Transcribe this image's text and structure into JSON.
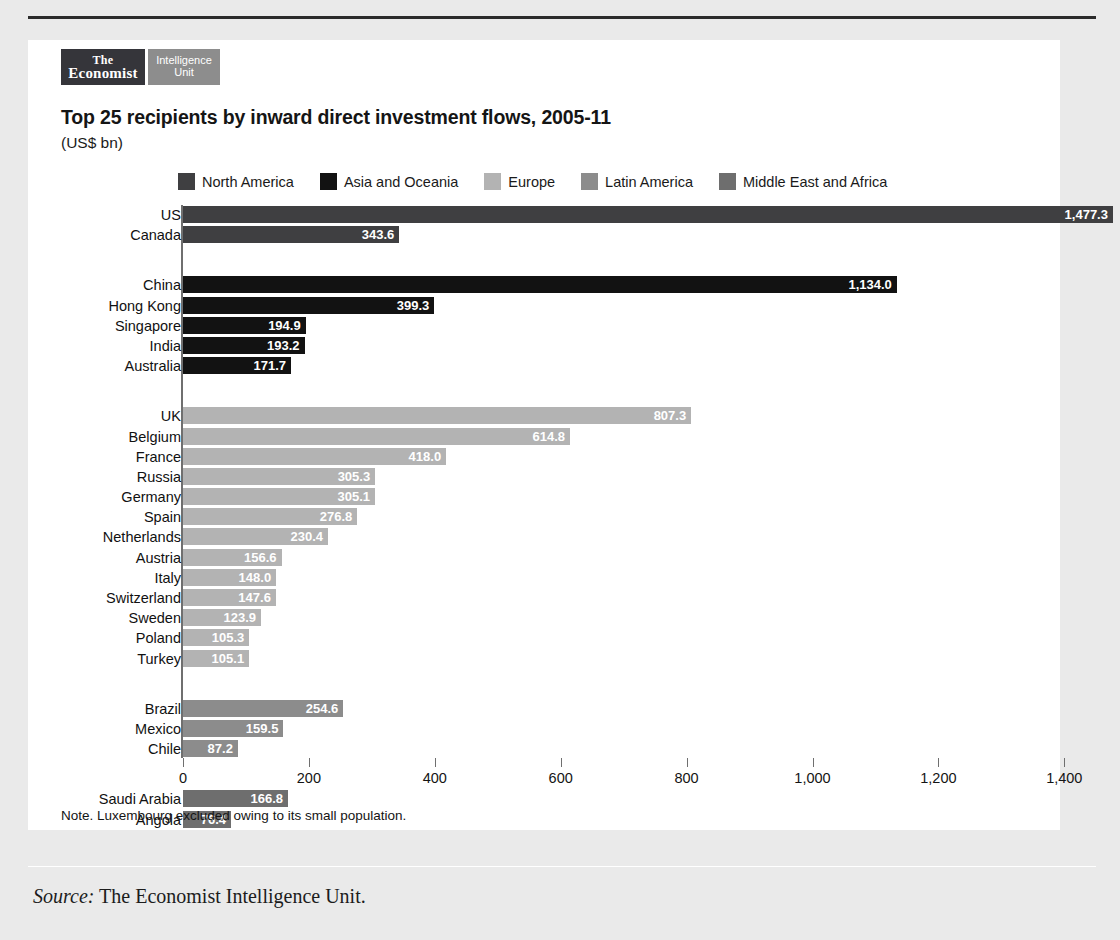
{
  "logo": {
    "economist_line1": "The",
    "economist_line2": "Economist",
    "eiu_line1": "Intelligence",
    "eiu_line2": "Unit"
  },
  "header": {
    "title": "Top 25 recipients by inward direct investment flows, 2005-11",
    "subtitle": "(US$ bn)"
  },
  "note": "Note. Luxembourg excluded owing to its small population.",
  "source": {
    "label": "Source:",
    "text": "The Economist Intelligence Unit."
  },
  "colors": {
    "north_america": "#3f3f41",
    "asia_oceania": "#121212",
    "europe": "#b3b3b3",
    "latin_america": "#8c8c8c",
    "middle_east_africa": "#6e6e6e",
    "axis": "#6f6f6f",
    "panel": "#ffffff",
    "page": "#eaeaea"
  },
  "chart_data": {
    "type": "bar",
    "orientation": "horizontal",
    "title": "Top 25 recipients by inward direct investment flows, 2005-11",
    "subtitle": "(US$ bn)",
    "xlabel": "",
    "ylabel": "",
    "xlim": [
      0,
      1600
    ],
    "xticks": [
      "0",
      "200",
      "400",
      "600",
      "800",
      "1,000",
      "1,200",
      "1,400",
      "1,600"
    ],
    "xtick_values": [
      0,
      200,
      400,
      600,
      800,
      1000,
      1200,
      1400,
      1600
    ],
    "grid": false,
    "legend_position": "top",
    "note": "Note. Luxembourg excluded owing to its small population.",
    "series": [
      {
        "name": "North America",
        "color": "#3f3f41"
      },
      {
        "name": "Asia and Oceania",
        "color": "#121212"
      },
      {
        "name": "Europe",
        "color": "#b3b3b3"
      },
      {
        "name": "Latin America",
        "color": "#8c8c8c"
      },
      {
        "name": "Middle East and Africa",
        "color": "#6e6e6e"
      }
    ],
    "groups": [
      {
        "series": "North America",
        "color": "#3f3f41",
        "items": [
          {
            "category": "US",
            "value": 1477.3,
            "label": "1,477.3"
          },
          {
            "category": "Canada",
            "value": 343.6,
            "label": "343.6"
          }
        ]
      },
      {
        "series": "Asia and Oceania",
        "color": "#121212",
        "items": [
          {
            "category": "China",
            "value": 1134.0,
            "label": "1,134.0"
          },
          {
            "category": "Hong Kong",
            "value": 399.3,
            "label": "399.3"
          },
          {
            "category": "Singapore",
            "value": 194.9,
            "label": "194.9"
          },
          {
            "category": "India",
            "value": 193.2,
            "label": "193.2"
          },
          {
            "category": "Australia",
            "value": 171.7,
            "label": "171.7"
          }
        ]
      },
      {
        "series": "Europe",
        "color": "#b3b3b3",
        "items": [
          {
            "category": "UK",
            "value": 807.3,
            "label": "807.3"
          },
          {
            "category": "Belgium",
            "value": 614.8,
            "label": "614.8"
          },
          {
            "category": "France",
            "value": 418.0,
            "label": "418.0"
          },
          {
            "category": "Russia",
            "value": 305.3,
            "label": "305.3"
          },
          {
            "category": "Germany",
            "value": 305.1,
            "label": "305.1"
          },
          {
            "category": "Spain",
            "value": 276.8,
            "label": "276.8"
          },
          {
            "category": "Netherlands",
            "value": 230.4,
            "label": "230.4"
          },
          {
            "category": "Austria",
            "value": 156.6,
            "label": "156.6"
          },
          {
            "category": "Italy",
            "value": 148.0,
            "label": "148.0"
          },
          {
            "category": "Switzerland",
            "value": 147.6,
            "label": "147.6"
          },
          {
            "category": "Sweden",
            "value": 123.9,
            "label": "123.9"
          },
          {
            "category": "Poland",
            "value": 105.3,
            "label": "105.3"
          },
          {
            "category": "Turkey",
            "value": 105.1,
            "label": "105.1"
          }
        ]
      },
      {
        "series": "Latin America",
        "color": "#8c8c8c",
        "items": [
          {
            "category": "Brazil",
            "value": 254.6,
            "label": "254.6"
          },
          {
            "category": "Mexico",
            "value": 159.5,
            "label": "159.5"
          },
          {
            "category": "Chile",
            "value": 87.2,
            "label": "87.2"
          }
        ]
      },
      {
        "series": "Middle East and Africa",
        "color": "#6e6e6e",
        "items": [
          {
            "category": "Saudi Arabia",
            "value": 166.8,
            "label": "166.8"
          },
          {
            "category": "Angola",
            "value": 76.4,
            "label": "76.4"
          }
        ]
      }
    ]
  }
}
